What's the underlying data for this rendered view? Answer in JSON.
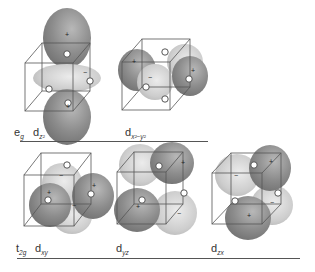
{
  "figure": {
    "colors": {
      "positive_lobe": "#8a8a8a",
      "negative_lobe": "#c6c6c6",
      "cube_edge": "#555555",
      "ligand": "#ffffff",
      "rule": "#555555"
    },
    "rows": [
      {
        "set_label": "e",
        "set_sub": "g",
        "orbitals": [
          {
            "label": "d",
            "sub": "z²",
            "name": "dz2"
          },
          {
            "label": "d",
            "sub": "x²−y²",
            "name": "dx2-y2"
          }
        ]
      },
      {
        "set_label": "t",
        "set_sub": "2g",
        "orbitals": [
          {
            "label": "d",
            "sub": "xy",
            "name": "dxy"
          },
          {
            "label": "d",
            "sub": "yz",
            "name": "dyz"
          },
          {
            "label": "d",
            "sub": "zx",
            "name": "dzx"
          }
        ]
      }
    ],
    "signs": {
      "plus": "+",
      "minus": "−"
    }
  }
}
